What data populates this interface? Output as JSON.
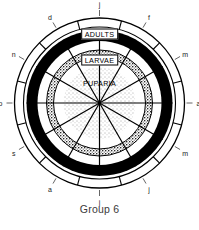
{
  "figure": {
    "caption": "Group 6",
    "type": "radial-phenology-diagram"
  },
  "ring_labels": {
    "outer": "ADULTS",
    "middle": "LARVAE",
    "inner": "PUPARIA"
  },
  "month_labels": [
    {
      "text": "j",
      "angle": -90
    },
    {
      "text": "f",
      "angle": -60
    },
    {
      "text": "m",
      "angle": -30
    },
    {
      "text": "a",
      "angle": 0
    },
    {
      "text": "m",
      "angle": 30
    },
    {
      "text": "j",
      "angle": 60
    },
    {
      "text": "j",
      "angle": 90
    },
    {
      "text": "a",
      "angle": 120
    },
    {
      "text": "s",
      "angle": 150
    },
    {
      "text": "o",
      "angle": 180
    },
    {
      "text": "n",
      "angle": 210
    },
    {
      "text": "d",
      "angle": 240
    }
  ],
  "chart_data": {
    "type": "pie",
    "title": "Group 6",
    "categories": [
      "j",
      "f",
      "m",
      "a",
      "m",
      "j",
      "j",
      "a",
      "s",
      "o",
      "n",
      "d"
    ],
    "series": [
      {
        "name": "ADULTS",
        "values": [
          1,
          1,
          1,
          1,
          1,
          1,
          1,
          1,
          1,
          1,
          1,
          1
        ]
      },
      {
        "name": "LARVAE",
        "values": [
          1,
          1,
          1,
          1,
          1,
          1,
          1,
          1,
          1,
          1,
          1,
          1
        ]
      },
      {
        "name": "PUPARIA",
        "values": [
          1,
          1,
          1,
          1,
          1,
          1,
          1,
          1,
          1,
          1,
          1,
          1
        ]
      }
    ],
    "xlabel": "",
    "ylabel": "",
    "legend": "none",
    "grid": false
  },
  "colors": {
    "ink": "#000000",
    "stipple": "#707070",
    "paper": "#ffffff",
    "caption": "#3a3a3a"
  }
}
